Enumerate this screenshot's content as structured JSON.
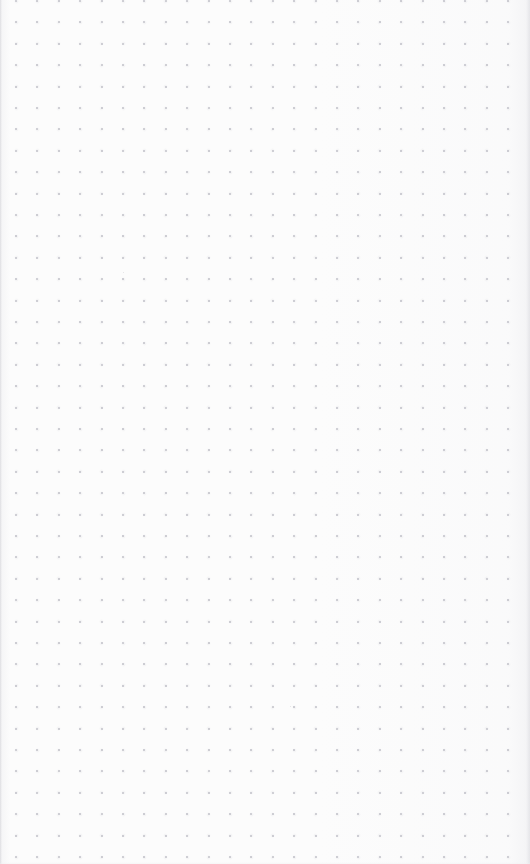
{
  "document": {
    "type": "dotted-grid-page",
    "title": "",
    "body_text": "",
    "has_text_content": false,
    "page_number": "",
    "header": "",
    "footer": ""
  },
  "page": {
    "width_px": 530,
    "height_px": 864,
    "background_color": "#fcfcfc",
    "paper_edge_color": "#d7d7db"
  },
  "grid": {
    "style": "dot",
    "dot_color": "#b6b6bf",
    "dot_diameter_px": 2,
    "spacing_px": 21.4,
    "columns": 24,
    "rows": 41,
    "origin_x_px": 16,
    "origin_y_px": 1,
    "first_row_clipped": true
  },
  "artifacts": {
    "specks": [
      {
        "x": 290,
        "y": 706
      },
      {
        "x": 123,
        "y": 272
      }
    ]
  },
  "annotations": []
}
